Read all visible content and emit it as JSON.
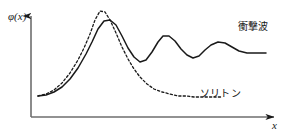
{
  "figure": {
    "background_color": "#ffffff",
    "ink_color": "#1a1a1a",
    "width": 291,
    "height": 136
  },
  "axes": {
    "y_label": "φ(x)",
    "x_label": "x",
    "y_axis_name": "vertical-axis",
    "x_axis_name": "horizontal-axis",
    "origin_x": 31,
    "origin_y": 117,
    "x_axis_end": 277,
    "y_axis_top": 14,
    "arrowheads": true,
    "ticks": false,
    "grid": false
  },
  "labels": {
    "shock_wave": "衝撃波",
    "soliton": "ソリトン"
  },
  "chart_data": {
    "type": "line",
    "title": "",
    "xlabel": "x",
    "ylabel": "φ(x)",
    "xlim": [
      31,
      277
    ],
    "ylim": [
      117,
      14
    ],
    "grid": false,
    "legend": "inline-annotations",
    "series": [
      {
        "name": "衝撃波",
        "style": "solid",
        "color": "#1a1a1a",
        "width": 1.5,
        "description": "Shock wave: rising front with a large leading peak followed by damped trailing oscillations settling to an elevated plateau.",
        "points": [
          [
            38,
            96
          ],
          [
            46,
            95
          ],
          [
            54,
            92
          ],
          [
            62,
            87
          ],
          [
            70,
            79
          ],
          [
            78,
            68
          ],
          [
            86,
            54
          ],
          [
            92,
            42
          ],
          [
            98,
            29
          ],
          [
            104,
            21
          ],
          [
            110,
            20
          ],
          [
            116,
            25
          ],
          [
            122,
            36
          ],
          [
            128,
            48
          ],
          [
            134,
            57
          ],
          [
            140,
            62
          ],
          [
            146,
            60
          ],
          [
            152,
            52
          ],
          [
            158,
            42
          ],
          [
            163,
            36
          ],
          [
            169,
            36
          ],
          [
            175,
            41
          ],
          [
            181,
            49
          ],
          [
            187,
            55
          ],
          [
            193,
            58
          ],
          [
            199,
            56
          ],
          [
            205,
            50
          ],
          [
            211,
            45
          ],
          [
            218,
            42
          ],
          [
            225,
            43
          ],
          [
            232,
            47
          ],
          [
            239,
            51
          ],
          [
            247,
            53
          ],
          [
            256,
            53
          ],
          [
            266,
            53
          ]
        ],
        "annotation": {
          "text": "衝撃波",
          "x": 238,
          "y": 22
        }
      },
      {
        "name": "ソリトン",
        "style": "dashed",
        "color": "#1a1a1a",
        "width": 1.3,
        "dash_pattern": "2.2 2.2",
        "description": "Soliton: single symmetric solitary pulse that decays monotonically back to the original baseline.",
        "points": [
          [
            38,
            96
          ],
          [
            46,
            94
          ],
          [
            54,
            90
          ],
          [
            62,
            83
          ],
          [
            70,
            73
          ],
          [
            78,
            60
          ],
          [
            84,
            48
          ],
          [
            90,
            34
          ],
          [
            95,
            20
          ],
          [
            100,
            11
          ],
          [
            105,
            12
          ],
          [
            110,
            20
          ],
          [
            116,
            33
          ],
          [
            122,
            47
          ],
          [
            128,
            59
          ],
          [
            134,
            69
          ],
          [
            140,
            77
          ],
          [
            147,
            84
          ],
          [
            154,
            89
          ],
          [
            162,
            92
          ],
          [
            170,
            94
          ],
          [
            178,
            96
          ],
          [
            186,
            96
          ],
          [
            194,
            97
          ],
          [
            202,
            97
          ],
          [
            212,
            97
          ],
          [
            222,
            97
          ]
        ],
        "annotation": {
          "text": "ソリトン",
          "x": 200,
          "y": 89
        }
      }
    ]
  }
}
